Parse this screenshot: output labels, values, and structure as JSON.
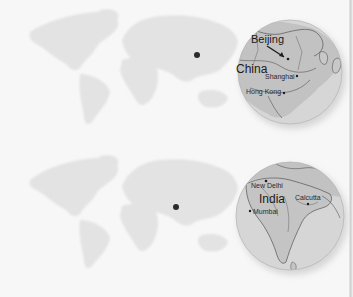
{
  "figure": {
    "panels": [
      {
        "id": "china",
        "country_label": "China",
        "cities": [
          {
            "name": "Beijing",
            "role": "capital"
          },
          {
            "name": "Shanghai",
            "role": "city"
          },
          {
            "name": "Hong Kong",
            "role": "city"
          }
        ],
        "location_marker": {
          "x": 197,
          "y": 55
        },
        "inset": {
          "cx": 290,
          "cy": 72,
          "r": 52
        }
      },
      {
        "id": "india",
        "country_label": "India",
        "cities": [
          {
            "name": "New Delhi",
            "role": "capital"
          },
          {
            "name": "Mumbai",
            "role": "city"
          },
          {
            "name": "Calcutta",
            "role": "city"
          }
        ],
        "location_marker": {
          "x": 176,
          "y": 207
        },
        "inset": {
          "cx": 290,
          "cy": 216,
          "r": 54
        }
      }
    ],
    "colors": {
      "background": "#f7f7f7",
      "world_land": "#e3e3e3",
      "inset_sea": "#d4d4d4",
      "inset_land": "#bdbdbd",
      "border_lines": "#555555",
      "marker": "#2b2b2b"
    }
  }
}
